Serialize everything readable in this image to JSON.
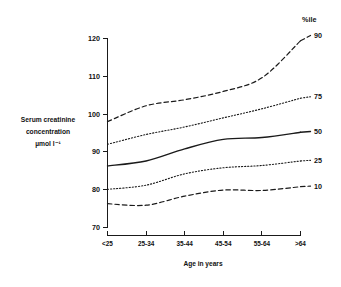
{
  "chart_data": {
    "type": "line",
    "title": "",
    "xlabel": "Age in years",
    "ylabel": "Serum creatinine concentration µmol l⁻¹",
    "ylabel_lines": [
      "Serum creatinine",
      "concentration",
      "µmol l⁻¹"
    ],
    "legend_title": "%ile",
    "legend_position": "right",
    "grid": false,
    "categories": [
      "<25",
      "25-34",
      "35-44",
      "45-54",
      "55-64",
      ">64"
    ],
    "x_tick_labels": [
      "<25",
      "25-34",
      "35-44",
      "45-54",
      "55-64",
      ">64"
    ],
    "y_tick_labels": [
      "70",
      "80",
      "90",
      "100",
      "110",
      "120"
    ],
    "y_ticks": [
      70,
      80,
      90,
      100,
      110,
      120
    ],
    "ylim": [
      68,
      122
    ],
    "series": [
      {
        "name": "90",
        "label": "90",
        "linestyle": "dashed",
        "color": "#1a1a1a",
        "values": [
          98.0,
          102.2,
          103.8,
          106.0,
          109.6,
          119.4
        ]
      },
      {
        "name": "75",
        "label": "75",
        "linestyle": "dotted",
        "color": "#1a1a1a",
        "values": [
          92.0,
          94.6,
          96.6,
          99.0,
          101.4,
          104.2
        ]
      },
      {
        "name": "50",
        "label": "50",
        "linestyle": "solid",
        "color": "#1a1a1a",
        "values": [
          86.3,
          87.6,
          90.8,
          93.3,
          93.8,
          95.2
        ]
      },
      {
        "name": "25",
        "label": "25",
        "linestyle": "dotted",
        "color": "#1a1a1a",
        "values": [
          80.1,
          81.2,
          84.2,
          85.8,
          86.4,
          87.6
        ]
      },
      {
        "name": "10",
        "label": "10",
        "linestyle": "dashed",
        "color": "#1a1a1a",
        "values": [
          76.3,
          75.9,
          78.3,
          79.9,
          79.8,
          80.8
        ]
      }
    ]
  }
}
